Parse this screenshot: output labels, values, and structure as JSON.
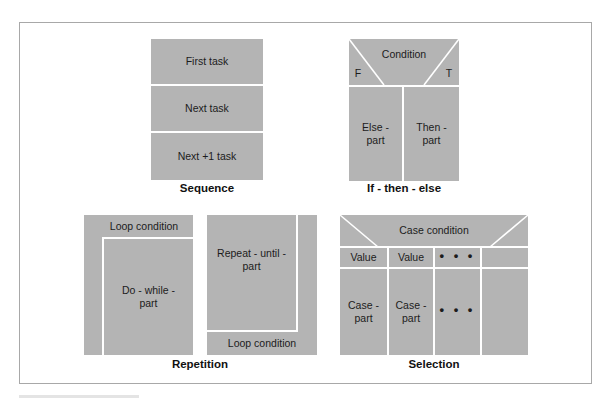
{
  "figure": {
    "box_color": "#b4b4b4",
    "divider_color": "#ffffff",
    "frame_color": "#a8a8a8"
  },
  "sequence": {
    "label": "Sequence",
    "tasks": [
      "First task",
      "Next task",
      "Next +1 task"
    ]
  },
  "if_then_else": {
    "label": "If - then - else",
    "condition": "Condition",
    "false_label": "F",
    "true_label": "T",
    "else_part": "Else -\npart",
    "then_part": "Then -\npart"
  },
  "repetition": {
    "label": "Repetition",
    "do_while": {
      "condition": "Loop condition",
      "body": "Do - while -\npart"
    },
    "repeat_until": {
      "body": "Repeat - until -\npart",
      "condition": "Loop condition"
    }
  },
  "selection": {
    "label": "Selection",
    "condition": "Case condition",
    "values": [
      "Value",
      "Value",
      "• • •",
      ""
    ],
    "parts": [
      "Case -\npart",
      "Case -\npart",
      "• • •",
      ""
    ]
  }
}
